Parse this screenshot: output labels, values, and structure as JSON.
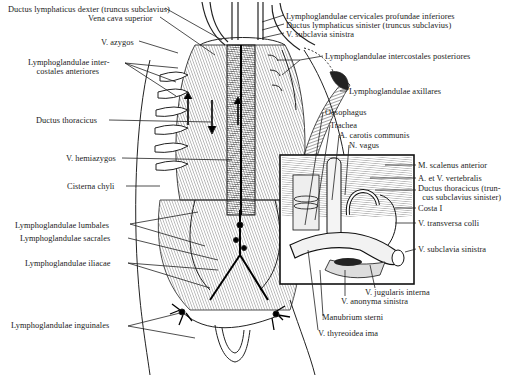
{
  "figure": {
    "inset_bounds": {
      "x": 280,
      "y": 155,
      "w": 134,
      "h": 129
    }
  },
  "labels": {
    "left": [
      {
        "id": "ductus-lymphaticus-dexter",
        "text": "Ductus lymphaticus dexter (truncus subclavius)",
        "x": 8,
        "y": 5
      },
      {
        "id": "vena-cava-superior",
        "text": "Vena cava superior",
        "x": 88,
        "y": 14
      },
      {
        "id": "v-azygos",
        "text": "V. azygos",
        "x": 101,
        "y": 38
      },
      {
        "id": "lymphoglandulae-intercostales-anteriores",
        "text": "Lymphoglandulae inter-\n    costales anteriores",
        "x": 28,
        "y": 58
      },
      {
        "id": "ductus-thoracicus",
        "text": "Ductus thoracicus",
        "x": 36,
        "y": 116
      },
      {
        "id": "v-hemiazygos",
        "text": "V. hemiazygos",
        "x": 66,
        "y": 154
      },
      {
        "id": "cisterna-chyli",
        "text": "Cisterna chyli",
        "x": 67,
        "y": 182
      },
      {
        "id": "lymphoglandulae-lumbales",
        "text": "Lymphoglandulae lumbales",
        "x": 15,
        "y": 221
      },
      {
        "id": "lymphoglandulae-sacrales",
        "text": "Lymphoglandulae sacrales",
        "x": 20,
        "y": 234
      },
      {
        "id": "lymphoglandulae-iliacae",
        "text": "Lymphoglandulae iliacae",
        "x": 25,
        "y": 259
      },
      {
        "id": "lymphoglandulae-inguinales",
        "text": "Lymphoglandulae inguinales",
        "x": 11,
        "y": 321
      }
    ],
    "right": [
      {
        "id": "lymphoglandulae-cervicales-profundae-inferiores",
        "text": "Lymphoglandulae cervicales profundae inferiores",
        "x": 286,
        "y": 12
      },
      {
        "id": "ductus-lymphaticus-sinister",
        "text": "Ductus lymphaticus sinister (truncus subclavius)",
        "x": 286,
        "y": 21
      },
      {
        "id": "v-subclavia-sinistra-top",
        "text": "V. subclavia sinistra",
        "x": 286,
        "y": 30
      },
      {
        "id": "lymphoglandulae-intercostales-posteriores",
        "text": "Lymphoglandulae intercostales posteriores",
        "x": 325,
        "y": 52
      },
      {
        "id": "lymphoglandulae-axillares",
        "text": "Lymphoglandulae axillares",
        "x": 349,
        "y": 87
      },
      {
        "id": "oesophagus",
        "text": "Oesophagus",
        "x": 325,
        "y": 108
      },
      {
        "id": "trachea",
        "text": "Trachea",
        "x": 330,
        "y": 121
      },
      {
        "id": "a-carotis-communis",
        "text": "A. carotis communis",
        "x": 339,
        "y": 131
      },
      {
        "id": "n-vagus",
        "text": "N. vagus",
        "x": 349,
        "y": 141
      },
      {
        "id": "m-scalenus-anterior",
        "text": "M. scalenus anterior",
        "x": 418,
        "y": 161
      },
      {
        "id": "a-et-v-vertebralis",
        "text": "A. et V. vertebralis",
        "x": 418,
        "y": 174
      },
      {
        "id": "ductus-thoracicus-inset",
        "text": "Ductus thoracicus (trun-\n  cus subclavius sinister)",
        "x": 418,
        "y": 184
      },
      {
        "id": "costa-i",
        "text": "Costa I",
        "x": 418,
        "y": 204
      },
      {
        "id": "v-transversa-colli",
        "text": "V. transversa colli",
        "x": 418,
        "y": 219
      },
      {
        "id": "v-subclavia-sinistra-inset",
        "text": "V. subclavia sinistra",
        "x": 418,
        "y": 245
      },
      {
        "id": "v-jugularis-interna",
        "text": "V. jugularis interna",
        "x": 365,
        "y": 288
      },
      {
        "id": "v-anonyma-sinistra",
        "text": "V. anonyma sinistra",
        "x": 341,
        "y": 297
      },
      {
        "id": "manubrium-sterni",
        "text": "Manubrium sterni",
        "x": 322,
        "y": 313
      },
      {
        "id": "v-thyreoidea-ima",
        "text": "V. thyreoidea ima",
        "x": 318,
        "y": 329
      }
    ]
  }
}
